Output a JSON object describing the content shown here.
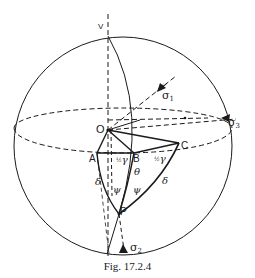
{
  "figure": {
    "caption": "Fig. 17.2.4",
    "labels": {
      "V": "V",
      "O": "O",
      "A": "A",
      "B": "B",
      "C": "C",
      "P": "P",
      "sigma1_main": "σ",
      "sigma1_sub": "1",
      "sigma2_main": "σ",
      "sigma2_sub": "2",
      "sigma3_main": "σ",
      "sigma3_sub": "3",
      "half_gamma_left_frac": "½",
      "half_gamma_left_sym": "γ",
      "half_gamma_right_frac": "½",
      "half_gamma_right_sym": "γ",
      "theta": "θ",
      "psi_left": "ψ",
      "psi_right": "ψ",
      "delta_left": "δ",
      "delta_right": "δ"
    },
    "colors": {
      "line": "#1a1a1a",
      "background": "#ffffff"
    }
  }
}
